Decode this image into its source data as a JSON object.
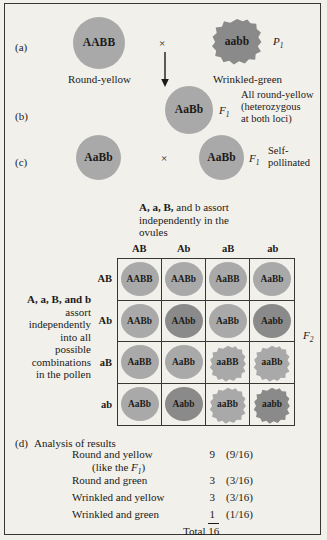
{
  "figure": {
    "background_color": "#f2f0ea",
    "border_color": "#3a3733",
    "round_yellow_color": "#a9a9a9",
    "round_green_color": "#8a8a8a",
    "wrinkled_yellow_color": "#aaaaaa",
    "wrinkled_green_color": "#8a8a8a"
  },
  "panel_a": {
    "letter": "(a)",
    "parent1_genotype": "AABB",
    "parent1_phenotype": "Round-yellow",
    "cross_symbol": "×",
    "parent2_genotype": "aabb",
    "parent2_phenotype": "Wrinkled-green",
    "generation": "P",
    "generation_sub": "1"
  },
  "panel_b": {
    "letter": "(b)",
    "genotype": "AaBb",
    "generation": "F",
    "generation_sub": "1",
    "note_line1": "All round-yellow",
    "note_line2": "(heterozygous",
    "note_line3": "at both loci)"
  },
  "panel_c": {
    "letter": "(c)",
    "left_genotype": "AaBb",
    "cross_symbol": "×",
    "right_genotype": "AaBb",
    "generation": "F",
    "generation_sub": "1",
    "note_line1": "Self-",
    "note_line2": "pollinated"
  },
  "ovule_note": {
    "line1_prefix": "A, a, B,",
    "line1_suffix": " and b assort",
    "line2": "independently in the",
    "line3": "ovules"
  },
  "pollen_note": {
    "line1": "A, a, B, and b",
    "line2": "assort",
    "line3": "independently",
    "line4": "into all",
    "line5": "possible",
    "line6": "combinations",
    "line7": "in the pollen"
  },
  "punnett": {
    "column_headers": [
      "AB",
      "Ab",
      "aB",
      "ab"
    ],
    "row_headers": [
      "AB",
      "Ab",
      "aB",
      "ab"
    ],
    "f2_label": "F",
    "f2_sub": "2",
    "cells": [
      {
        "genotype": "AABB",
        "shape": "round",
        "color": "yellow"
      },
      {
        "genotype": "AABb",
        "shape": "round",
        "color": "yellow"
      },
      {
        "genotype": "AaBB",
        "shape": "round",
        "color": "yellow"
      },
      {
        "genotype": "AaBb",
        "shape": "round",
        "color": "yellow"
      },
      {
        "genotype": "AABb",
        "shape": "round",
        "color": "yellow"
      },
      {
        "genotype": "AAbb",
        "shape": "round",
        "color": "green"
      },
      {
        "genotype": "AaBb",
        "shape": "round",
        "color": "yellow"
      },
      {
        "genotype": "Aabb",
        "shape": "round",
        "color": "green"
      },
      {
        "genotype": "AaBB",
        "shape": "round",
        "color": "yellow"
      },
      {
        "genotype": "AaBb",
        "shape": "round",
        "color": "yellow"
      },
      {
        "genotype": "aaBB",
        "shape": "wrinkled",
        "color": "yellow"
      },
      {
        "genotype": "aaBb",
        "shape": "wrinkled",
        "color": "yellow"
      },
      {
        "genotype": "AaBb",
        "shape": "round",
        "color": "yellow"
      },
      {
        "genotype": "Aabb",
        "shape": "round",
        "color": "green"
      },
      {
        "genotype": "aaBb",
        "shape": "wrinkled",
        "color": "yellow"
      },
      {
        "genotype": "aabb",
        "shape": "wrinkled",
        "color": "green"
      }
    ]
  },
  "analysis": {
    "letter": "(d)",
    "heading": "Analysis of results",
    "rows": [
      {
        "name": "Round and yellow",
        "subnote_pre": "(like the ",
        "subnote_gen": "F",
        "subnote_sub": "1",
        "subnote_post": ")",
        "count": "9",
        "fraction": "(9/16)"
      },
      {
        "name": "Round and green",
        "count": "3",
        "fraction": "(3/16)"
      },
      {
        "name": "Wrinkled and yellow",
        "count": "3",
        "fraction": "(3/16)"
      },
      {
        "name": "Wrinkled and green",
        "count": "1",
        "fraction": "(1/16)"
      }
    ],
    "total_label": "Total",
    "total_value": "16"
  }
}
